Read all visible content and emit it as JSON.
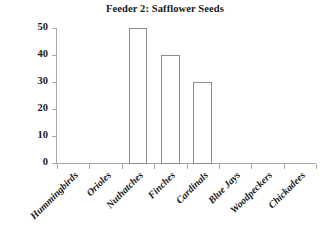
{
  "chart_data": {
    "type": "bar",
    "title": "Feeder 2: Safflower Seeds",
    "xlabel": "",
    "ylabel": "",
    "categories": [
      "Hummingbirds",
      "Orioles",
      "Nuthatches",
      "Finches",
      "Cardinals",
      "Blue Jays",
      "Woodpeckers",
      "Chickadees"
    ],
    "values": [
      0,
      0,
      50,
      40,
      30,
      0,
      0,
      0
    ],
    "ylim": [
      0,
      50
    ],
    "yticks": [
      0,
      10,
      20,
      30,
      40,
      50
    ],
    "ytick_labels": [
      "0",
      "10",
      "20",
      "30",
      "40",
      "50"
    ],
    "grid": false,
    "legend": false,
    "bar_fill_color": "#ffffff",
    "bar_edge_color": "#8c8c8c",
    "axis_color": "#a8a8a8",
    "text_color": "#1a1a1a",
    "background_color": "#ffffff"
  }
}
